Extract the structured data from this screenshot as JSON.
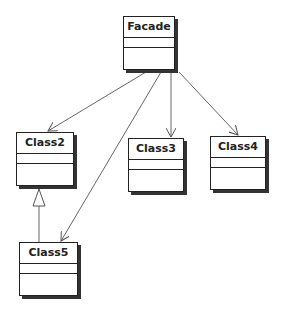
{
  "diagram": {
    "type": "uml-class-diagram",
    "classes": [
      {
        "id": "facade",
        "name": "Facade"
      },
      {
        "id": "class2",
        "name": "Class2"
      },
      {
        "id": "class3",
        "name": "Class3"
      },
      {
        "id": "class4",
        "name": "Class4"
      },
      {
        "id": "class5",
        "name": "Class5"
      }
    ],
    "relations": [
      {
        "from": "Facade",
        "to": "Class2",
        "kind": "association"
      },
      {
        "from": "Facade",
        "to": "Class3",
        "kind": "association"
      },
      {
        "from": "Facade",
        "to": "Class4",
        "kind": "association"
      },
      {
        "from": "Facade",
        "to": "Class5",
        "kind": "association"
      },
      {
        "from": "Class5",
        "to": "Class2",
        "kind": "generalization"
      }
    ],
    "colors": {
      "line": "#555555",
      "border": "#222222",
      "shadow": "#333333",
      "background": "#ffffff"
    }
  }
}
